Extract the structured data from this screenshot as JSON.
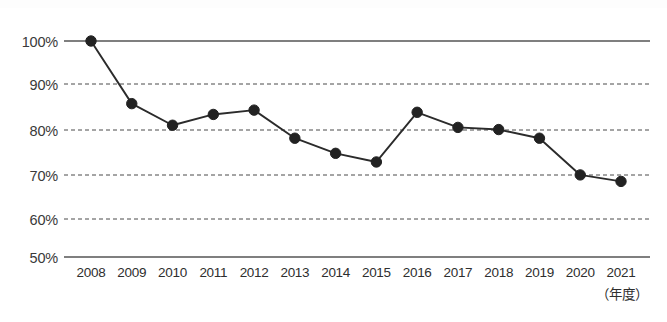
{
  "chart_data": {
    "type": "line",
    "title": "",
    "xlabel": "（年度）",
    "ylabel": "",
    "categories": [
      "2008",
      "2009",
      "2010",
      "2011",
      "2012",
      "2013",
      "2014",
      "2015",
      "2016",
      "2017",
      "2018",
      "2019",
      "2020",
      "2021"
    ],
    "values": [
      100,
      85.5,
      80.5,
      83,
      84,
      77.5,
      74,
      72,
      83.5,
      80,
      79.5,
      77.5,
      69,
      67.5
    ],
    "ylim": [
      50,
      100
    ],
    "ytick_labels": [
      "100%",
      "90%",
      "80%",
      "70%",
      "60%",
      "50%"
    ],
    "ytick_values": [
      100,
      90,
      80,
      70,
      60,
      50
    ],
    "grid": true,
    "grid_style": "dashed-horizontal",
    "legend": "none",
    "series_color": "#222222",
    "gridline_color": "#4a4a4a",
    "axis_color": "#555555",
    "marker": "filled-circle"
  },
  "axis": {
    "y_unit_suffix": "%",
    "x_unit_note": "（年度）"
  }
}
